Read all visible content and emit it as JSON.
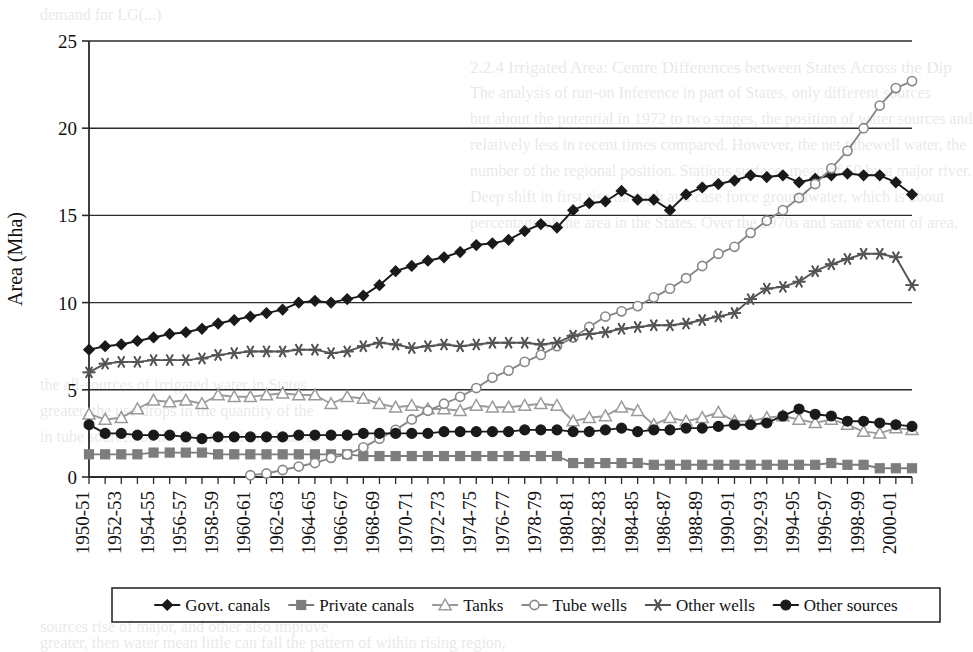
{
  "figure": {
    "background_color": "#ffffff",
    "ink_color": "#111111"
  },
  "bleedthrough": [
    {
      "text": "demand for LG(...)",
      "x": 40,
      "y": 6,
      "size": 16
    },
    {
      "text": "2.2.4   Irrigated Area: Centre Differences between States Across the Dip",
      "x": 470,
      "y": 58,
      "size": 17
    },
    {
      "text": "The analysis of run-on Inference in part of States, only different sources",
      "x": 470,
      "y": 84,
      "size": 16
    },
    {
      "text": "but about the potential in 1972 to two stages, the position of water sources and",
      "x": 470,
      "y": 110,
      "size": 16
    },
    {
      "text": "relatively less in recent times compared. However, the net tubewell water, the",
      "x": 470,
      "y": 136,
      "size": 16
    },
    {
      "text": "number of the regional position. Stations surface, mean of 50 by a major river.",
      "x": 470,
      "y": 162,
      "size": 16
    },
    {
      "text": "Deep shift in first rise through and case force groundwater, which is about",
      "x": 470,
      "y": 188,
      "size": 16
    },
    {
      "text": "percentage of the area in the States. Over the 1970s and same extent of area.",
      "x": 470,
      "y": 214,
      "size": 16
    },
    {
      "text": "the all-sources of irrigated water in States",
      "x": 40,
      "y": 376,
      "size": 16
    },
    {
      "text": "greater, the use drops in the quantity of the",
      "x": 40,
      "y": 402,
      "size": 16
    },
    {
      "text": "in tube sources of the given and much areas",
      "x": 40,
      "y": 428,
      "size": 16
    },
    {
      "text": "sources rise of major, and other also improve",
      "x": 40,
      "y": 618,
      "size": 16
    },
    {
      "text": "greater, then water mean little can fall the pattern of within rising region,",
      "x": 40,
      "y": 634,
      "size": 16
    }
  ],
  "chart_data": {
    "type": "line",
    "title": "",
    "xlabel": "",
    "ylabel": "Area (Mha)",
    "ylim": [
      0,
      25
    ],
    "yticks": [
      0,
      5,
      10,
      15,
      20,
      25
    ],
    "ytick_labels": [
      "0",
      "5",
      "10",
      "15",
      "20",
      "25"
    ],
    "grid": true,
    "grid_axis": "y",
    "legend_position": "bottom",
    "x": [
      "1950-51",
      "1951-52",
      "1952-53",
      "1953-54",
      "1954-55",
      "1955-56",
      "1956-57",
      "1957-58",
      "1958-59",
      "1959-60",
      "1960-61",
      "1961-62",
      "1962-63",
      "1963-64",
      "1964-65",
      "1965-66",
      "1966-67",
      "1967-68",
      "1968-69",
      "1969-70",
      "1970-71",
      "1971-72",
      "1972-73",
      "1973-74",
      "1974-75",
      "1975-76",
      "1976-77",
      "1977-78",
      "1978-79",
      "1979-80",
      "1980-81",
      "1981-82",
      "1982-83",
      "1983-84",
      "1984-85",
      "1985-86",
      "1986-87",
      "1987-88",
      "1988-89",
      "1989-90",
      "1990-91",
      "1991-92",
      "1992-93",
      "1993-94",
      "1994-95",
      "1995-96",
      "1996-97",
      "1997-98",
      "1998-99",
      "1999-2000",
      "2000-01",
      "2001-02"
    ],
    "xtick_labels": [
      "1950-51",
      "1952-53",
      "1954-55",
      "1956-57",
      "1958-59",
      "1960-61",
      "1962-63",
      "1964-65",
      "1966-67",
      "1968-69",
      "1970-71",
      "1972-73",
      "1974-75",
      "1976-77",
      "1978-79",
      "1980-81",
      "1982-83",
      "1984-85",
      "1986-87",
      "1988-89",
      "1990-91",
      "1992-93",
      "1994-95",
      "1996-97",
      "1998-99",
      "2000-01"
    ],
    "xtick_step": 2,
    "series": [
      {
        "name": "Govt. canals",
        "marker": "diamond",
        "marker_filled": true,
        "color": "#1a1a1a",
        "values": [
          7.3,
          7.5,
          7.6,
          7.8,
          8.0,
          8.2,
          8.3,
          8.5,
          8.8,
          9.0,
          9.2,
          9.4,
          9.6,
          10.0,
          10.1,
          10.0,
          10.2,
          10.4,
          11.0,
          11.8,
          12.1,
          12.4,
          12.6,
          12.9,
          13.3,
          13.4,
          13.6,
          14.1,
          14.5,
          14.3,
          15.3,
          15.7,
          15.8,
          16.4,
          15.9,
          15.9,
          15.3,
          16.2,
          16.6,
          16.8,
          17.0,
          17.3,
          17.2,
          17.3,
          16.9,
          17.1,
          17.3,
          17.4,
          17.3,
          17.3,
          16.9,
          16.2
        ]
      },
      {
        "name": "Private canals",
        "marker": "square",
        "marker_filled": true,
        "color": "#7d7d7d",
        "values": [
          1.3,
          1.3,
          1.3,
          1.3,
          1.4,
          1.4,
          1.4,
          1.4,
          1.3,
          1.3,
          1.3,
          1.3,
          1.3,
          1.3,
          1.3,
          1.3,
          1.3,
          1.2,
          1.2,
          1.2,
          1.2,
          1.2,
          1.2,
          1.2,
          1.2,
          1.2,
          1.2,
          1.2,
          1.2,
          1.2,
          0.8,
          0.8,
          0.8,
          0.8,
          0.8,
          0.7,
          0.7,
          0.7,
          0.7,
          0.7,
          0.7,
          0.7,
          0.7,
          0.7,
          0.7,
          0.7,
          0.8,
          0.7,
          0.7,
          0.5,
          0.5,
          0.5
        ]
      },
      {
        "name": "Tanks",
        "marker": "triangle",
        "marker_filled": false,
        "color": "#9a9a9a",
        "values": [
          3.6,
          3.3,
          3.4,
          3.9,
          4.4,
          4.3,
          4.4,
          4.2,
          4.7,
          4.6,
          4.6,
          4.7,
          4.8,
          4.7,
          4.7,
          4.2,
          4.6,
          4.5,
          4.2,
          4.0,
          4.1,
          3.9,
          3.9,
          3.8,
          4.1,
          4.0,
          4.0,
          4.1,
          4.2,
          4.1,
          3.2,
          3.4,
          3.5,
          4.0,
          3.8,
          3.0,
          3.4,
          3.2,
          3.4,
          3.7,
          3.2,
          3.2,
          3.4,
          3.5,
          3.3,
          3.1,
          3.3,
          3.0,
          2.6,
          2.5,
          2.8,
          2.7
        ]
      },
      {
        "name": "Tube wells",
        "marker": "circle",
        "marker_filled": false,
        "color": "#888888",
        "values": [
          null,
          null,
          null,
          null,
          null,
          null,
          null,
          null,
          null,
          null,
          0.1,
          0.2,
          0.4,
          0.6,
          0.8,
          1.1,
          1.3,
          1.7,
          2.2,
          2.7,
          3.3,
          3.8,
          4.2,
          4.6,
          5.1,
          5.7,
          6.1,
          6.6,
          7.0,
          7.5,
          8.0,
          8.6,
          9.2,
          9.5,
          9.8,
          10.3,
          10.8,
          11.4,
          12.1,
          12.8,
          13.2,
          14.0,
          14.7,
          15.3,
          16.0,
          16.8,
          17.7,
          18.7,
          20.0,
          21.3,
          22.3,
          22.7
        ]
      },
      {
        "name": "Other wells",
        "marker": "asterisk",
        "marker_filled": true,
        "color": "#555555",
        "values": [
          6.0,
          6.5,
          6.6,
          6.6,
          6.7,
          6.7,
          6.7,
          6.8,
          7.0,
          7.1,
          7.2,
          7.2,
          7.2,
          7.3,
          7.3,
          7.1,
          7.2,
          7.5,
          7.7,
          7.6,
          7.4,
          7.5,
          7.6,
          7.5,
          7.6,
          7.7,
          7.7,
          7.7,
          7.6,
          7.7,
          8.1,
          8.2,
          8.3,
          8.5,
          8.6,
          8.7,
          8.7,
          8.8,
          9.0,
          9.2,
          9.4,
          10.2,
          10.8,
          10.9,
          11.2,
          11.8,
          12.2,
          12.5,
          12.8,
          12.8,
          12.6,
          11.0
        ]
      },
      {
        "name": "Other sources",
        "marker": "circle",
        "marker_filled": true,
        "color": "#1a1a1a",
        "values": [
          3.0,
          2.5,
          2.5,
          2.4,
          2.4,
          2.4,
          2.3,
          2.2,
          2.3,
          2.3,
          2.3,
          2.3,
          2.3,
          2.4,
          2.4,
          2.4,
          2.4,
          2.5,
          2.5,
          2.5,
          2.5,
          2.5,
          2.6,
          2.6,
          2.6,
          2.6,
          2.6,
          2.7,
          2.7,
          2.7,
          2.6,
          2.6,
          2.7,
          2.8,
          2.6,
          2.7,
          2.7,
          2.8,
          2.8,
          2.9,
          3.0,
          3.0,
          3.1,
          3.5,
          3.9,
          3.6,
          3.5,
          3.2,
          3.2,
          3.1,
          3.0,
          2.9
        ]
      }
    ]
  },
  "legend": {
    "entries": [
      {
        "label": "Govt. canals"
      },
      {
        "label": "Private canals"
      },
      {
        "label": "Tanks"
      },
      {
        "label": "Tube wells"
      },
      {
        "label": "Other wells"
      },
      {
        "label": "Other sources"
      }
    ]
  }
}
